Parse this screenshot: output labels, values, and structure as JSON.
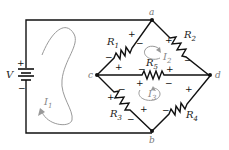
{
  "diagram": {
    "type": "circuit",
    "source": {
      "label": "V",
      "plus": "+",
      "minus": "−"
    },
    "nodes": {
      "a": "a",
      "b": "b",
      "c": "c",
      "d": "d"
    },
    "resistors": {
      "R1": {
        "name": "R",
        "sub": "1",
        "between": "c-a"
      },
      "R2": {
        "name": "R",
        "sub": "2",
        "between": "a-d"
      },
      "R3": {
        "name": "R",
        "sub": "3",
        "between": "c-b"
      },
      "R4": {
        "name": "R",
        "sub": "4",
        "between": "b-d"
      },
      "R5": {
        "name": "R",
        "sub": "5",
        "between": "c-d"
      }
    },
    "currents": {
      "I1": {
        "name": "I",
        "sub": "1"
      },
      "I2": {
        "name": "I",
        "sub": "2"
      },
      "I3": {
        "name": "I",
        "sub": "3"
      }
    },
    "polarity": {
      "plus": "+",
      "minus": "−"
    },
    "colors": {
      "wire": "#111111",
      "loop": "#999999",
      "node_label": "#777777"
    }
  }
}
